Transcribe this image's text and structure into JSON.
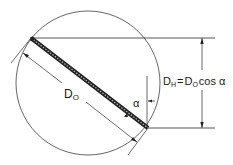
{
  "diagram": {
    "title": "",
    "labels": {
      "bar_length_main": "D",
      "bar_length_sub": "O",
      "angle": "α",
      "projection_main": "D",
      "projection_sub": "H",
      "equals": "=",
      "formula_main": "D",
      "formula_sub": "O",
      "formula_tail": "cos α"
    },
    "formula_text": "D_H = D_O cos α",
    "colors": {
      "line": "#3a3a3a",
      "bar": "#2a2a2a",
      "background": "#ffffff"
    }
  }
}
